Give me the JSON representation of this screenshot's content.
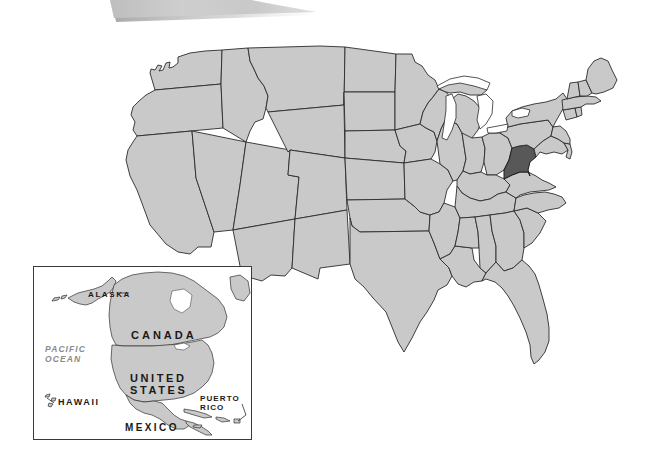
{
  "figure": {
    "kind": "locator-map",
    "subject": "United States",
    "highlighted_state": "West Virginia"
  },
  "colors": {
    "page_background": "#ffffff",
    "state_fill": "#c9c9c9",
    "state_border": "#2b2b2b",
    "highlight_fill": "#585858",
    "highlight_border": "#1c1c1c",
    "lake_fill": "#ffffff",
    "inset_border": "#3a3a3a",
    "inset_background": "#ffffff",
    "banner_fill": "#b4b4b4",
    "ocean_label_color": "#8b8b8b",
    "label_color": "#1a1a1a"
  },
  "banner": {
    "name": "top-slanted-bar",
    "visible": true
  },
  "main_map": {
    "name": "united-states-map",
    "highlight": {
      "state": "West Virginia",
      "fill": "#585858"
    },
    "lakes_visible": true
  },
  "inset": {
    "name": "north-america-inset",
    "labels": [
      {
        "id": "alaska",
        "text": "ALASKA",
        "style": "bold"
      },
      {
        "id": "canada",
        "text": "CANADA",
        "style": "bold"
      },
      {
        "id": "pacific",
        "text": "PACIFIC\nOCEAN",
        "style": "italic-bold"
      },
      {
        "id": "us",
        "text": "UNITED\nSTATES",
        "style": "bold"
      },
      {
        "id": "hawaii",
        "text": "HAWAII",
        "style": "bold"
      },
      {
        "id": "puerto",
        "text": "PUERTO\nRICO",
        "style": "bold"
      },
      {
        "id": "mexico",
        "text": "MEXICO",
        "style": "bold"
      }
    ]
  }
}
